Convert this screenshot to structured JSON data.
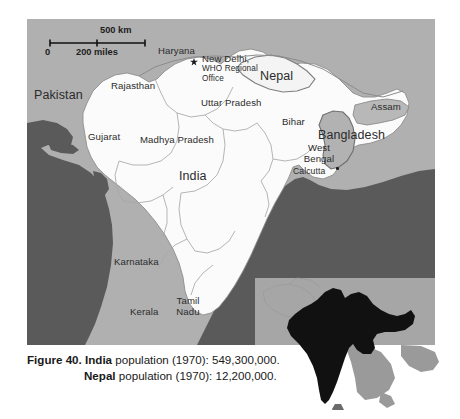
{
  "figure": {
    "caption_prefix": "Figure 40.",
    "line1_country": "India",
    "line1_rest": " population (1970): 549,300,000.",
    "line2_country": "Nepal",
    "line2_rest": " population (1970): 12,200,000."
  },
  "scale": {
    "km_label": "500 km",
    "zero_label": "0",
    "miles_label": "200 miles"
  },
  "labels": {
    "pakistan": "Pakistan",
    "haryana": "Haryana",
    "rajasthan": "Rajasthan",
    "new_delhi": "New Delhi,",
    "who_office_line1": "WHO Regional",
    "who_office_line2": "Office",
    "nepal": "Nepal",
    "uttar_pradesh": "Uttar Pradesh",
    "gujarat": "Gujarat",
    "madhya_pradesh": "Madhya Pradesh",
    "india": "India",
    "bihar": "Bihar",
    "assam": "Assam",
    "bangladesh": "Bangladesh",
    "west_bengal_line1": "West",
    "west_bengal_line2": "Bengal",
    "calcutta": "Calcutta",
    "karnataka": "Karnataka",
    "kerala": "Kerala",
    "tamil_nadu_line1": "Tamil",
    "tamil_nadu_line2": "Nadu"
  },
  "colors": {
    "page_background": "#ffffff",
    "ocean": "#5a5a5a",
    "neighbor_country": "#b0b0b0",
    "india_fill": "#fbfbfb",
    "nepal_fill": "#f4f4f4",
    "border_line": "#9a9a9a",
    "inset_background": "#9d9d9d",
    "inset_silhouette": "#111111",
    "label_text": "#2b2b2b"
  }
}
